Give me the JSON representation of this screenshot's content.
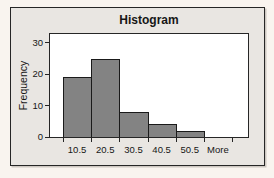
{
  "window": {
    "background": "#f9f4ef"
  },
  "chart": {
    "title": "Histogram",
    "frame_background": "#e9e6e2",
    "plot_background": "#ffffff",
    "line_color": "#262626",
    "text_color": "#161616",
    "bar_fill": "#838383",
    "bar_border": "#1a1a1a"
  },
  "chart_data": {
    "type": "bar",
    "title": "Histogram",
    "xlabel": "",
    "ylabel": "Frequency",
    "categories": [
      "10.5",
      "20.5",
      "30.5",
      "40.5",
      "50.5",
      "More"
    ],
    "values": [
      19,
      25,
      8,
      4,
      2,
      0
    ],
    "ylim": [
      0,
      30
    ],
    "yticks": [
      0,
      10,
      20,
      30
    ],
    "y_plot_max": 32.8,
    "grid": false,
    "legend": false,
    "bar_gap": 0
  }
}
